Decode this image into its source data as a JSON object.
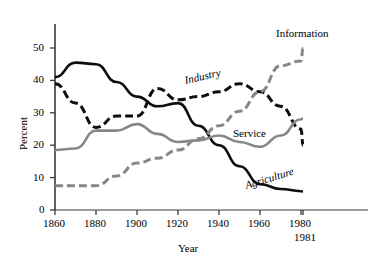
{
  "chart_data": {
    "type": "line",
    "title": "",
    "xlabel": "Year",
    "ylabel": "Percent",
    "xlim": [
      1860,
      1985
    ],
    "ylim": [
      0,
      55
    ],
    "grid": false,
    "legend_position": "inline-labels",
    "x_ticks": [
      1860,
      1880,
      1900,
      1920,
      1940,
      1960,
      1980
    ],
    "x_tick_labels": [
      "1860",
      "1880",
      "1900",
      "1920",
      "1940",
      "1960",
      "1980"
    ],
    "x_extra_tick": 1981,
    "x_extra_tick_label": "1981",
    "y_ticks": [
      0,
      10,
      20,
      30,
      40,
      50
    ],
    "y_tick_labels": [
      "0",
      "10",
      "20",
      "30",
      "40",
      "50"
    ],
    "series": [
      {
        "name": "Agriculture",
        "style": "solid",
        "color": "#0d0d0d",
        "x": [
          1860,
          1870,
          1880,
          1890,
          1900,
          1910,
          1920,
          1930,
          1940,
          1950,
          1960,
          1970,
          1980,
          1981
        ],
        "values": [
          41.0,
          45.5,
          45.0,
          39.5,
          35.0,
          32.0,
          33.0,
          26.0,
          20.0,
          13.5,
          8.0,
          6.5,
          5.8,
          5.7
        ]
      },
      {
        "name": "Industry",
        "style": "dashed",
        "color": "#0d0d0d",
        "x": [
          1860,
          1870,
          1880,
          1890,
          1900,
          1910,
          1920,
          1930,
          1940,
          1950,
          1960,
          1970,
          1980,
          1981
        ],
        "values": [
          39.0,
          33.0,
          25.5,
          29.0,
          29.0,
          37.5,
          34.0,
          35.0,
          36.5,
          39.0,
          36.5,
          32.0,
          25.0,
          20.0
        ]
      },
      {
        "name": "Service",
        "style": "solid",
        "color": "#878787",
        "x": [
          1860,
          1870,
          1880,
          1890,
          1900,
          1910,
          1920,
          1930,
          1940,
          1950,
          1960,
          1970,
          1980,
          1981
        ],
        "values": [
          18.5,
          19.0,
          24.5,
          24.5,
          26.5,
          23.5,
          21.0,
          21.5,
          23.0,
          21.0,
          19.5,
          23.0,
          28.0,
          28.2
        ]
      },
      {
        "name": "Information",
        "style": "dashed",
        "color": "#878787",
        "x": [
          1860,
          1870,
          1880,
          1890,
          1900,
          1910,
          1920,
          1930,
          1940,
          1950,
          1960,
          1970,
          1980,
          1981
        ],
        "values": [
          7.5,
          7.5,
          7.5,
          10.5,
          14.5,
          16.0,
          18.5,
          22.0,
          26.0,
          30.5,
          36.5,
          44.5,
          46.0,
          50.0
        ]
      }
    ],
    "annotations": [
      {
        "text": "Information",
        "series": "Information"
      },
      {
        "text": "Industry",
        "series": "Industry"
      },
      {
        "text": "Service",
        "series": "Service"
      },
      {
        "text": "Agriculture",
        "series": "Agriculture"
      }
    ]
  },
  "axis": {
    "ylabel": "Percent",
    "xlabel": "Year"
  }
}
